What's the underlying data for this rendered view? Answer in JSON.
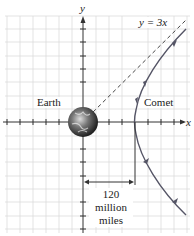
{
  "diagram": {
    "axis_labels": {
      "x": "x",
      "y": "y"
    },
    "asymptote_label": "y = 3x",
    "earth_label": "Earth",
    "comet_label": "Comet",
    "distance_label": {
      "line1": "120",
      "line2": "million",
      "line3": "miles"
    },
    "colors": {
      "grid": "#d9d9d9",
      "axis": "#333333",
      "comet": "#555566",
      "frame": "#cfcfcf"
    }
  }
}
